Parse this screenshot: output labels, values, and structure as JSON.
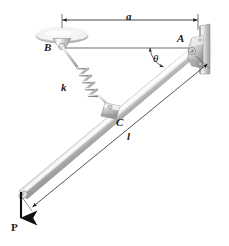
{
  "figure": {
    "type": "engineering-mechanics-free-body-diagram",
    "background_color": "#ffffff",
    "ink_color": "#1a1a1a",
    "metal_light": "#f2f2f2",
    "metal_mid": "#c9c9c9",
    "metal_dark": "#9a9a9a",
    "metal_shadow": "#7d7d7d"
  },
  "labels": {
    "dimension_a": "a",
    "point_A": "A",
    "point_B": "B",
    "point_C": "C",
    "angle_theta": "θ",
    "spring_constant": "k",
    "length_l": "l",
    "force_P": "P"
  },
  "geometry": {
    "point_A": {
      "x": 194,
      "y": 52
    },
    "point_B": {
      "x": 62,
      "y": 45
    },
    "point_C": {
      "x": 112,
      "y": 110
    },
    "bar_free_end": {
      "x": 21,
      "y": 193
    },
    "dimension_a_line_y": 20,
    "dimension_a_from_x": 62,
    "dimension_a_to_x": 198,
    "horizontal_reference_y": 48,
    "angle_theta_vertex": {
      "x": 168,
      "y": 48
    },
    "wall_x": 200,
    "wall_top": 26,
    "wall_bottom": 74,
    "force_P_tail": {
      "x": 21,
      "y": 192
    },
    "force_P_head": {
      "x": 21,
      "y": 222
    }
  },
  "elements": [
    {
      "name": "ceiling-mount-support-B",
      "kind": "pivot-support"
    },
    {
      "name": "wall-pin-support-A",
      "kind": "pin-support"
    },
    {
      "name": "rigid-bar",
      "kind": "structural-member"
    },
    {
      "name": "coil-spring",
      "kind": "spring"
    },
    {
      "name": "collar-C",
      "kind": "collar-joint"
    },
    {
      "name": "load-arrow-P",
      "kind": "force-vector"
    },
    {
      "name": "dimension-line-a",
      "kind": "dimension"
    },
    {
      "name": "dimension-line-l",
      "kind": "dimension"
    },
    {
      "name": "angle-arc-theta",
      "kind": "angle-dimension"
    }
  ]
}
